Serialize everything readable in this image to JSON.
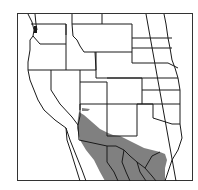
{
  "map": {
    "title": "Range map",
    "region": "Western North America",
    "colors": {
      "background": "#ffffff",
      "border": "#1a1a1a",
      "range_fill": "#808080",
      "frame": "#333333"
    },
    "layers": [
      {
        "name": "state-boundaries",
        "label": "State boundaries"
      },
      {
        "name": "range",
        "label": "Distribution range"
      }
    ]
  }
}
